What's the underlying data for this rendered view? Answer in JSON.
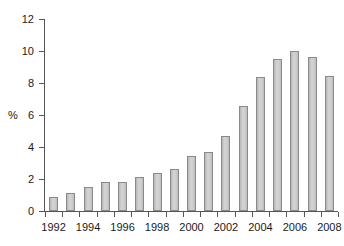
{
  "chart_data": {
    "type": "bar",
    "title": "",
    "subtitle": "",
    "xlabel": "",
    "ylabel": "%",
    "ylim": [
      0,
      12
    ],
    "y_ticks": [
      0,
      2,
      4,
      6,
      8,
      10,
      12
    ],
    "grid": false,
    "legend": null,
    "categories": [
      "1992",
      "1993",
      "1994",
      "1995",
      "1996",
      "1997",
      "1998",
      "1999",
      "2000",
      "2001",
      "2002",
      "2003",
      "2004",
      "2005",
      "2006",
      "2007",
      "2008"
    ],
    "x_tick_labels": [
      "1992",
      "",
      "1994",
      "",
      "1996",
      "",
      "1998",
      "",
      "2000",
      "",
      "2002",
      "",
      "2004",
      "",
      "2006",
      "",
      "2008"
    ],
    "values": [
      0.9,
      1.15,
      1.5,
      1.8,
      1.8,
      2.1,
      2.35,
      2.65,
      3.45,
      3.7,
      4.7,
      6.55,
      8.4,
      9.5,
      10.0,
      9.6,
      8.45
    ],
    "series": [
      {
        "name": "",
        "values": [
          0.9,
          1.15,
          1.5,
          1.8,
          1.8,
          2.1,
          2.35,
          2.65,
          3.45,
          3.7,
          4.7,
          6.55,
          8.4,
          9.5,
          10.0,
          9.6,
          8.45
        ]
      }
    ],
    "colors": {
      "bar_fill": "#c9c9c9",
      "bar_border": "#8a8a8a",
      "axis": "#555555",
      "text": "#1a1a1a",
      "background": "#ffffff"
    }
  }
}
